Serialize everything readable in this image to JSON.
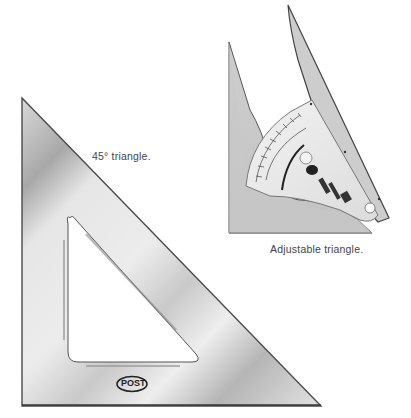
{
  "figures": {
    "triangle_45": {
      "caption": "45° triangle.",
      "logo_text": "POST"
    },
    "adjustable_triangle": {
      "caption": "Adjustable triangle."
    }
  },
  "colors": {
    "plastic_light": "#e9e9e9",
    "plastic_mid": "#cfcfcf",
    "plastic_dark": "#a9a9a9",
    "edge": "#555555",
    "caption_text": "#444444"
  }
}
